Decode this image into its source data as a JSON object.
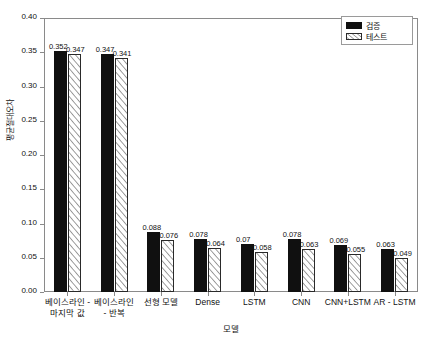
{
  "chart_data": {
    "type": "bar",
    "title": "",
    "xlabel": "모델",
    "ylabel": "평균절대오차",
    "ylim": [
      0.0,
      0.4
    ],
    "yticks": [
      "0.00",
      "0.05",
      "0.10",
      "0.15",
      "0.20",
      "0.25",
      "0.30",
      "0.35",
      "0.40"
    ],
    "ytick_values": [
      0.0,
      0.05,
      0.1,
      0.15,
      0.2,
      0.25,
      0.3,
      0.35,
      0.4
    ],
    "grid": false,
    "legend_position": "top-right",
    "categories": [
      "베이스라인 -\n마지막 값",
      "베이스라인\n- 반복",
      "선형 모델",
      "Dense",
      "LSTM",
      "CNN",
      "CNN+LSTM",
      "AR - LSTM"
    ],
    "series": [
      {
        "name": "검증",
        "values": [
          0.352,
          0.347,
          0.088,
          0.078,
          0.07,
          0.078,
          0.069,
          0.063
        ],
        "labels": [
          "0.352",
          "0.347",
          "0.088",
          "0.078",
          "0.07",
          "0.078",
          "0.069",
          "0.063"
        ],
        "color": "#101010",
        "fill": "solid"
      },
      {
        "name": "테스트",
        "values": [
          0.347,
          0.341,
          0.076,
          0.064,
          0.058,
          0.063,
          0.055,
          0.049
        ],
        "labels": [
          "0.347",
          "0.341",
          "0.076",
          "0.064",
          "0.058",
          "0.063",
          "0.055",
          "0.049"
        ],
        "color": "#ffffff",
        "fill": "diagonal-hatch"
      }
    ]
  },
  "legend": {
    "entries": [
      {
        "label": "검증",
        "swatch": "solid-black-swatch"
      },
      {
        "label": "테스트",
        "swatch": "hatched-swatch"
      }
    ]
  }
}
